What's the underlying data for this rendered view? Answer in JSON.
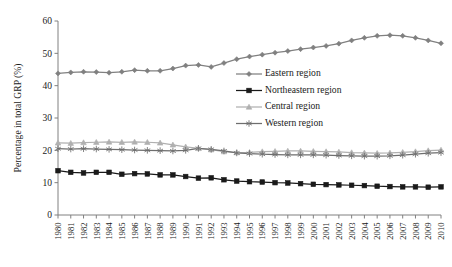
{
  "chart_data": {
    "type": "line",
    "title": "",
    "subtitle": "",
    "xlabel": "",
    "ylabel": "Percentage in total GRP (%)",
    "ylim": [
      0,
      60
    ],
    "yticks": [
      0,
      10,
      20,
      30,
      40,
      50,
      60
    ],
    "grid": false,
    "legend_position": "inside-right-upper",
    "x": [
      "1980",
      "1981",
      "1982",
      "1983",
      "1984",
      "1985",
      "1986",
      "1987",
      "1988",
      "1989",
      "1990",
      "1991",
      "1992",
      "1993",
      "1994",
      "1995",
      "1996",
      "1997",
      "1998",
      "1999",
      "2000",
      "2001",
      "2002",
      "2003",
      "2004",
      "2005",
      "2006",
      "2007",
      "2008",
      "2009",
      "2010"
    ],
    "categories": [
      "1980",
      "1981",
      "1982",
      "1983",
      "1984",
      "1985",
      "1986",
      "1987",
      "1988",
      "1989",
      "1990",
      "1991",
      "1992",
      "1993",
      "1994",
      "1995",
      "1996",
      "1997",
      "1998",
      "1999",
      "2000",
      "2001",
      "2002",
      "2003",
      "2004",
      "2005",
      "2006",
      "2007",
      "2008",
      "2009",
      "2010"
    ],
    "series": [
      {
        "name": "Eastern region",
        "marker": "diamond",
        "color": "#808080",
        "values": [
          43.8,
          44.1,
          44.3,
          44.2,
          44.0,
          44.3,
          44.8,
          44.6,
          44.6,
          45.3,
          46.2,
          46.4,
          45.8,
          47.0,
          48.2,
          49.0,
          49.6,
          50.2,
          50.7,
          51.3,
          51.8,
          52.3,
          53.0,
          54.0,
          54.8,
          55.4,
          55.6,
          55.4,
          54.8,
          54.0,
          53.1
        ]
      },
      {
        "name": "Northeastern region",
        "marker": "square",
        "color": "#1a1a1a",
        "values": [
          13.7,
          13.2,
          13.0,
          13.2,
          13.2,
          12.6,
          12.8,
          12.7,
          12.4,
          12.4,
          11.9,
          11.4,
          11.5,
          10.9,
          10.5,
          10.3,
          10.2,
          10.0,
          9.9,
          9.7,
          9.5,
          9.4,
          9.3,
          9.2,
          9.1,
          8.9,
          8.8,
          8.7,
          8.7,
          8.6,
          8.7
        ]
      },
      {
        "name": "Central region",
        "marker": "triangle",
        "color": "#b0b0b0",
        "values": [
          22.3,
          22.2,
          22.4,
          22.5,
          22.6,
          22.5,
          22.6,
          22.5,
          22.3,
          21.7,
          21.1,
          20.6,
          20.2,
          19.6,
          19.3,
          19.4,
          19.6,
          19.7,
          19.8,
          19.8,
          19.7,
          19.6,
          19.5,
          19.3,
          19.2,
          19.1,
          19.2,
          19.4,
          19.6,
          19.9,
          20.1
        ]
      },
      {
        "name": "Western region",
        "marker": "star",
        "color": "#6e6e6e",
        "values": [
          20.5,
          20.4,
          20.5,
          20.4,
          20.3,
          20.2,
          20.1,
          20.0,
          19.9,
          19.8,
          20.0,
          20.6,
          20.3,
          19.8,
          19.2,
          19.0,
          18.8,
          18.7,
          18.6,
          18.6,
          18.6,
          18.5,
          18.4,
          18.3,
          18.2,
          18.2,
          18.3,
          18.5,
          18.8,
          19.1,
          19.3
        ]
      }
    ]
  },
  "legend": {
    "items": [
      {
        "label": "Eastern region"
      },
      {
        "label": "Northeastern region"
      },
      {
        "label": "Central region"
      },
      {
        "label": "Western region"
      }
    ]
  }
}
